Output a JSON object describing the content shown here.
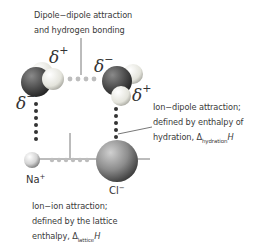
{
  "labels": {
    "dipole_line1": "Dipole−dipole attraction",
    "dipole_line2": "and hydrogen bonding",
    "ion_dipole_line1": "Ion−dipole attraction;",
    "ion_dipole_line2": "defined by enthalpy of",
    "ion_dipole_line3_prefix": "hydration, Δ",
    "ion_dipole_line3_sub": "hydration",
    "ion_dipole_line3_suffix": "H",
    "ion_ion_line1": "Ion−ion attraction;",
    "ion_ion_line2": "defined by the lattice",
    "ion_ion_line3_prefix": "enthalpy, Δ",
    "ion_ion_line3_sub": "lattice",
    "ion_ion_line3_suffix": "H"
  },
  "symbols": {
    "delta": "δ",
    "plus": "+",
    "minus": "−",
    "sodium": "Na",
    "chloride": "Cl",
    "sodium_charge": "+",
    "chloride_charge": "−"
  },
  "colors": {
    "oxygen": "#4a4a4a",
    "hydrogen": "#e8e8e0",
    "sodium": "#d8d8d8",
    "chloride": "#909090",
    "dipole_dots": "#bdbdbd",
    "ion_dipole_dots": "#333333",
    "text": "#3a3a3a"
  }
}
